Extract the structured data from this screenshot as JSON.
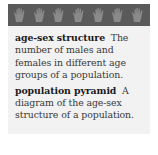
{
  "banner": {
    "background": "#5a5a5a",
    "icon": "hand-icon",
    "icon_count": 7
  },
  "glossary": {
    "entries": [
      {
        "term": "age-sex structure",
        "definition": "The number of males and females in different age groups of a population."
      },
      {
        "term": "population pyramid",
        "definition": "A diagram of the age-sex structure of a population."
      }
    ]
  },
  "colors": {
    "panel": "#f2f2f2",
    "banner": "#5a5a5a",
    "hand": "#8a8a8a",
    "term_text": "#1a1a1a",
    "definition_text": "#3a3a3a"
  }
}
